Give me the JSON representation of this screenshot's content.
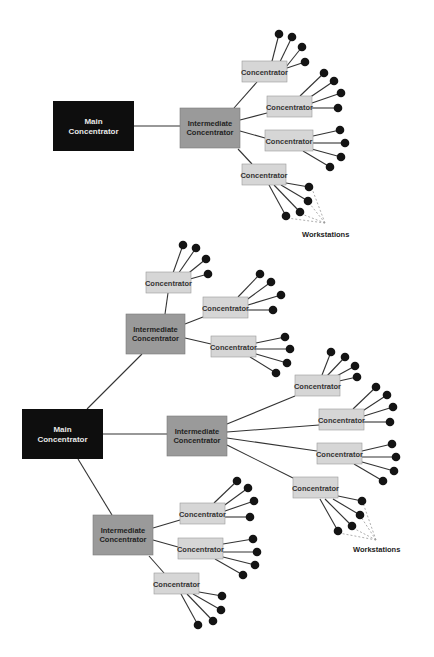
{
  "colors": {
    "background": "#ffffff",
    "main_fill": "#0e0e0e",
    "main_text": "#e8e8e8",
    "intermediate_fill": "#9a9a9a",
    "intermediate_text": "#222222",
    "concentrator_fill": "#d6d6d6",
    "concentrator_stroke": "#9a9a9a",
    "concentrator_text": "#333333",
    "line": "#333333",
    "workstation": "#141414",
    "dashed": "#999999"
  },
  "diagrams": [
    {
      "name": "two-level",
      "main": {
        "x": 53,
        "y": 101,
        "w": 81,
        "h": 50,
        "lines": [
          "Main",
          "Concentrator"
        ]
      },
      "intermediates": [
        {
          "x": 180,
          "y": 108,
          "w": 60,
          "h": 40,
          "lines": [
            "Intermediate",
            "Concentrator"
          ],
          "attach": [
            134,
            126,
            180,
            126
          ]
        }
      ],
      "concentrators": [
        {
          "x": 242,
          "y": 61,
          "w": 45,
          "h": 21,
          "label": "Concentrator",
          "link": [
            234,
            108,
            257,
            82
          ],
          "ws": [
            [
              270,
              69,
              279,
              34
            ],
            [
              276,
              70,
              292,
              37
            ],
            [
              282,
              72,
              302,
              47
            ],
            [
              287,
              68,
              305,
              62
            ]
          ]
        },
        {
          "x": 267,
          "y": 96,
          "w": 45,
          "h": 21,
          "label": "Concentrator",
          "link": [
            240,
            120,
            267,
            113
          ],
          "ws": [
            [
              300,
              96,
              324,
              73
            ],
            [
              306,
              100,
              334,
              81
            ],
            [
              312,
              103,
              341,
              93
            ],
            [
              312,
              108,
              338,
              108
            ]
          ]
        },
        {
          "x": 265,
          "y": 130,
          "w": 48,
          "h": 21,
          "label": "Concentrator",
          "link": [
            240,
            131,
            265,
            138
          ],
          "ws": [
            [
              313,
              136,
              340,
              130
            ],
            [
              313,
              143,
              345,
              143
            ],
            [
              308,
              148,
              341,
              157
            ],
            [
              303,
              151,
              330,
              167
            ]
          ]
        },
        {
          "x": 242,
          "y": 164,
          "w": 44,
          "h": 21,
          "label": "Concentrator",
          "link": [
            238,
            149,
            252,
            164
          ],
          "ws": [
            [
              286,
              183,
              309,
              187
            ],
            [
              281,
              185,
              308,
              201
            ],
            [
              274,
              185,
              300,
              212
            ],
            [
              269,
              185,
              286,
              216
            ]
          ]
        }
      ],
      "workstations_label": {
        "x": 302,
        "y": 237,
        "text": "Workstations"
      },
      "dashed": [
        [
          325,
          223,
          311,
          186
        ],
        [
          325,
          223,
          306,
          199
        ],
        [
          325,
          223,
          299,
          213
        ],
        [
          325,
          223,
          287,
          218
        ]
      ]
    },
    {
      "name": "three-level",
      "main": {
        "x": 22,
        "y": 409,
        "w": 81,
        "h": 50,
        "lines": [
          "Main",
          "Concentrator"
        ]
      },
      "intermediates": [
        {
          "x": 126,
          "y": 314,
          "w": 59,
          "h": 40,
          "lines": [
            "Intermediate",
            "Concentrator"
          ],
          "attach": [
            87,
            409,
            142,
            354
          ]
        },
        {
          "x": 167,
          "y": 416,
          "w": 60,
          "h": 40,
          "lines": [
            "Intermediate",
            "Concentrator"
          ],
          "attach": [
            103,
            434,
            167,
            434
          ]
        },
        {
          "x": 93,
          "y": 515,
          "w": 60,
          "h": 40,
          "lines": [
            "Intermediate",
            "Concentrator"
          ],
          "attach": [
            78,
            459,
            112,
            515
          ]
        }
      ],
      "concentrators": [
        {
          "x": 146,
          "y": 272,
          "w": 45,
          "h": 21,
          "label": "Concentrator",
          "link": [
            165,
            314,
            168,
            293
          ],
          "ws": [
            [
              173,
              273,
              183,
              245
            ],
            [
              178,
              274,
              196,
              248
            ],
            [
              185,
              276,
              206,
              259
            ],
            [
              190,
              279,
              208,
              274
            ]
          ]
        },
        {
          "x": 203,
          "y": 297,
          "w": 45,
          "h": 21,
          "label": "Concentrator",
          "link": [
            185,
            324,
            203,
            317
          ],
          "ws": [
            [
              238,
              297,
              260,
              274
            ],
            [
              245,
              301,
              271,
              282
            ],
            [
              248,
              305,
              281,
              295
            ],
            [
              248,
              310,
              273,
              310
            ]
          ]
        },
        {
          "x": 211,
          "y": 336,
          "w": 45,
          "h": 21,
          "label": "Concentrator",
          "link": [
            185,
            338,
            211,
            344
          ],
          "ws": [
            [
              256,
              343,
              285,
              337
            ],
            [
              256,
              349,
              290,
              349
            ],
            [
              256,
              354,
              287,
              363
            ],
            [
              250,
              357,
              276,
              373
            ]
          ]
        },
        {
          "x": 295,
          "y": 375,
          "w": 45,
          "h": 21,
          "label": "Concentrator",
          "link": [
            227,
            424,
            295,
            396
          ],
          "ws": [
            [
              322,
              375,
              331,
              352
            ],
            [
              327,
              376,
              345,
              357
            ],
            [
              333,
              378,
              355,
              366
            ],
            [
              339,
              381,
              357,
              377
            ]
          ]
        },
        {
          "x": 319,
          "y": 409,
          "w": 45,
          "h": 21,
          "label": "Concentrator",
          "link": [
            227,
            432,
            319,
            425
          ],
          "ws": [
            [
              353,
              409,
              376,
              387
            ],
            [
              361,
              412,
              387,
              395
            ],
            [
              364,
              416,
              393,
              407
            ],
            [
              364,
              422,
              390,
              422
            ]
          ]
        },
        {
          "x": 317,
          "y": 443,
          "w": 45,
          "h": 21,
          "label": "Concentrator",
          "link": [
            227,
            438,
            317,
            451
          ],
          "ws": [
            [
              362,
              451,
              392,
              444
            ],
            [
              362,
              457,
              396,
              457
            ],
            [
              362,
              462,
              394,
              471
            ],
            [
              354,
              464,
              383,
              481
            ]
          ]
        },
        {
          "x": 293,
          "y": 477,
          "w": 45,
          "h": 21,
          "label": "Concentrator",
          "link": [
            227,
            445,
            293,
            478
          ],
          "ws": [
            [
              338,
              496,
              362,
              501
            ],
            [
              333,
              499,
              360,
              515
            ],
            [
              325,
              499,
              352,
              526
            ],
            [
              320,
              499,
              338,
              531
            ]
          ]
        },
        {
          "x": 180,
          "y": 503,
          "w": 45,
          "h": 21,
          "label": "Concentrator",
          "link": [
            153,
            528,
            180,
            520
          ],
          "ws": [
            [
              214,
              503,
              237,
              481
            ],
            [
              222,
              507,
              248,
              488
            ],
            [
              225,
              511,
              254,
              501
            ],
            [
              225,
              517,
              250,
              517
            ]
          ]
        },
        {
          "x": 178,
          "y": 538,
          "w": 45,
          "h": 21,
          "label": "Concentrator",
          "link": [
            153,
            540,
            178,
            547
          ],
          "ws": [
            [
              223,
              544,
              253,
              539
            ],
            [
              223,
              552,
              257,
              552
            ],
            [
              223,
              557,
              255,
              565
            ],
            [
              215,
              559,
              243,
              575
            ]
          ]
        },
        {
          "x": 154,
          "y": 573,
          "w": 45,
          "h": 21,
          "label": "Concentrator",
          "link": [
            149,
            556,
            164,
            573
          ],
          "ws": [
            [
              199,
              592,
              222,
              596
            ],
            [
              193,
              594,
              221,
              610
            ],
            [
              187,
              594,
              213,
              621
            ],
            [
              181,
              594,
              198,
              625
            ]
          ]
        }
      ],
      "workstations_label": {
        "x": 353,
        "y": 552,
        "text": "Workstations"
      },
      "dashed": [
        [
          376,
          540,
          363,
          503
        ],
        [
          376,
          540,
          361,
          517
        ],
        [
          376,
          540,
          353,
          528
        ],
        [
          376,
          540,
          339,
          533
        ]
      ]
    }
  ]
}
